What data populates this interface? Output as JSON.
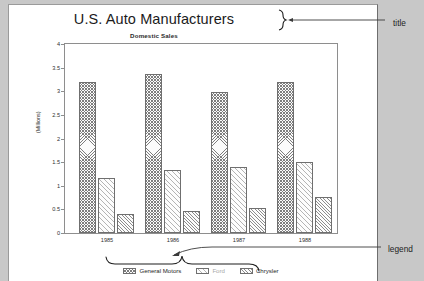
{
  "chart_data": {
    "type": "bar",
    "title": "U.S. Auto Manufacturers",
    "subtitle": "Domestic Sales",
    "xlabel": "",
    "ylabel": "(Millions)",
    "categories": [
      "1985",
      "1986",
      "1987",
      "1988"
    ],
    "ylim": [
      0,
      4
    ],
    "yticks": [
      "0",
      "0.5",
      "1",
      "1.5",
      "2",
      "2.5",
      "3",
      "3.5",
      "4"
    ],
    "ytick_values": [
      0,
      0.5,
      1,
      1.5,
      2,
      2.5,
      3,
      3.5,
      4
    ],
    "grid": false,
    "legend_position": "bottom",
    "series": [
      {
        "name": "General Motors",
        "values": [
          3.19,
          3.36,
          2.98,
          3.19
        ]
      },
      {
        "name": "Ford",
        "values": [
          1.17,
          1.34,
          1.39,
          1.5
        ]
      },
      {
        "name": "Chrysler",
        "values": [
          0.41,
          0.46,
          0.54,
          0.76
        ]
      }
    ]
  },
  "annotations": {
    "title_callout": "title",
    "legend_callout": "legend"
  }
}
